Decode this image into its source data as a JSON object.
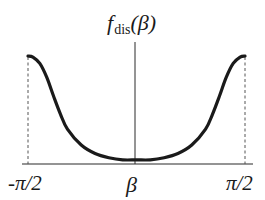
{
  "chart_data": {
    "type": "line",
    "title": "",
    "ylabel": "f_dis(β)",
    "ylabel_parts": {
      "main": "f",
      "sub": "dis",
      "arg": "(β)"
    },
    "xlabel": "β",
    "xticks": [
      "-π/2",
      "π/2"
    ],
    "xlim": [
      -1.5708,
      1.5708
    ],
    "ylim": [
      0,
      1
    ],
    "grid": false,
    "legend": null,
    "annotations": [
      "dashed vertical lines at β = -π/2 and β = π/2"
    ],
    "series": [
      {
        "name": "f_dis(β)",
        "x": [
          -1.5708,
          -1.5,
          -1.4,
          -1.3,
          -1.2,
          -1.1,
          -1.0,
          -0.8,
          -0.6,
          -0.4,
          -0.2,
          0.0,
          0.2,
          0.4,
          0.6,
          0.8,
          1.0,
          1.1,
          1.2,
          1.3,
          1.4,
          1.5,
          1.5708
        ],
        "y": [
          1.0,
          0.99,
          0.93,
          0.8,
          0.62,
          0.45,
          0.31,
          0.16,
          0.08,
          0.04,
          0.02,
          0.02,
          0.02,
          0.04,
          0.08,
          0.16,
          0.31,
          0.45,
          0.62,
          0.8,
          0.93,
          0.99,
          1.0
        ]
      }
    ]
  },
  "labels": {
    "y_main": "f",
    "y_sub": "dis",
    "y_arg": "(β)",
    "x_axis": "β",
    "x_left": "-π/2",
    "x_right": "π/2"
  },
  "colors": {
    "curve": "#1a1a1a",
    "axis": "#2a2a2a",
    "dashed": "#555555"
  }
}
